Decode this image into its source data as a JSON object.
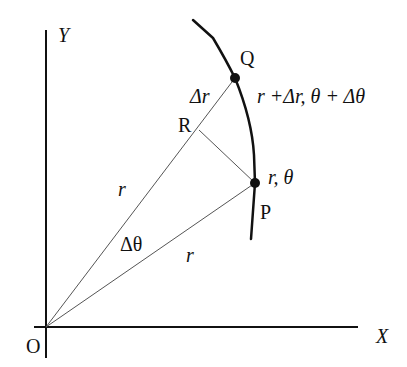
{
  "diagram": {
    "axes": {
      "x_label": "X",
      "y_label": "Y",
      "origin_label": "O"
    },
    "points": {
      "P": {
        "label": "P",
        "coord_label": "r, θ"
      },
      "Q": {
        "label": "Q",
        "coord_label": "r +Δr, θ + Δθ"
      },
      "R": {
        "label": "R"
      }
    },
    "segment_labels": {
      "OR_length": "r",
      "OP_length": "r",
      "RQ_length": "Δr",
      "angle_POQ": "Δθ"
    },
    "colors": {
      "ink": "#111111",
      "thin_line": "#555555",
      "background": "#ffffff"
    }
  }
}
